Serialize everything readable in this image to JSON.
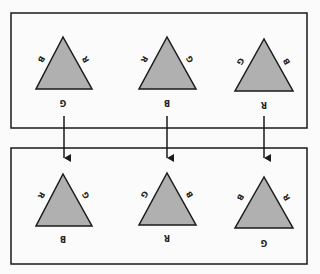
{
  "diagram": {
    "colors": {
      "triangle_fill": "#b0b0b0",
      "stroke": "#1a1a1a",
      "background": "#fbfbfb"
    },
    "top_row": [
      {
        "left": "B",
        "right": "R",
        "bottom": "G"
      },
      {
        "left": "R",
        "right": "G",
        "bottom": "B"
      },
      {
        "left": "G",
        "right": "B",
        "bottom": "R"
      }
    ],
    "bottom_row": [
      {
        "left": "R",
        "right": "G",
        "bottom": "B"
      },
      {
        "left": "G",
        "right": "B",
        "bottom": "R"
      },
      {
        "left": "B",
        "right": "R",
        "bottom": "G"
      }
    ],
    "arrows": 3
  }
}
